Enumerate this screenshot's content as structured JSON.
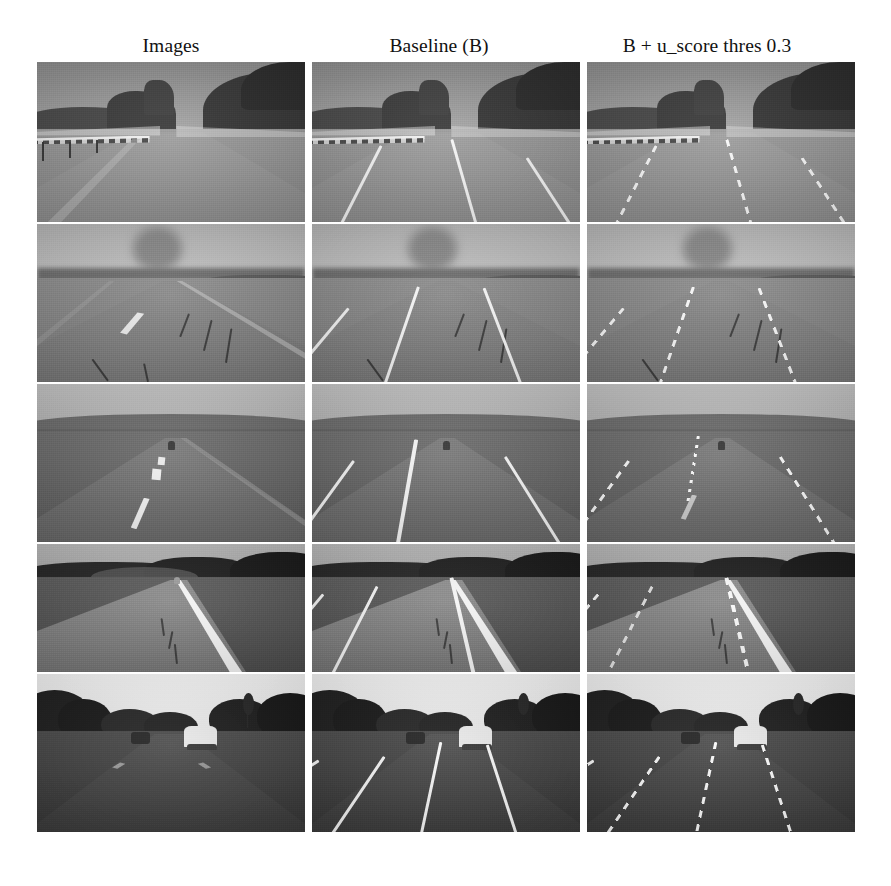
{
  "figure": {
    "type": "qualitative-comparison-grid",
    "columns": 3,
    "rows": 5,
    "colorspace": "grayscale"
  },
  "headers": [
    {
      "label": "Images"
    },
    {
      "label": "Baseline (B)"
    },
    {
      "label": "B + u_score thres 0.3"
    }
  ],
  "rows": [
    {
      "scene": "desert highway with metal guardrail and rocky mountains",
      "cells": [
        {
          "column": "Images",
          "overlay": "none"
        },
        {
          "column": "Baseline (B)",
          "overlay": "solid lane lines"
        },
        {
          "column": "B + u_score thres 0.3",
          "overlay": "dashed lane lines"
        }
      ]
    },
    {
      "scene": "straight desert road with cracked asphalt and dust plume",
      "cells": [
        {
          "column": "Images",
          "overlay": "none"
        },
        {
          "column": "Baseline (B)",
          "overlay": "solid lane lines"
        },
        {
          "column": "B + u_score thres 0.3",
          "overlay": "dashed lane lines"
        }
      ]
    },
    {
      "scene": "open desert road with dashed centerline and distant hills",
      "cells": [
        {
          "column": "Images",
          "overlay": "none"
        },
        {
          "column": "Baseline (B)",
          "overlay": "solid lane lines"
        },
        {
          "column": "B + u_score thres 0.3",
          "overlay": "dashed lane lines"
        }
      ]
    },
    {
      "scene": "two-lane road bordered by dark tree line with bright right edge line",
      "cells": [
        {
          "column": "Images",
          "overlay": "none"
        },
        {
          "column": "Baseline (B)",
          "overlay": "solid lane lines"
        },
        {
          "column": "B + u_score thres 0.3",
          "overlay": "dashed lane lines"
        }
      ]
    },
    {
      "scene": "suburban road with trees, white truck ahead and bright overcast sky",
      "cells": [
        {
          "column": "Images",
          "overlay": "none"
        },
        {
          "column": "Baseline (B)",
          "overlay": "four solid lane lines"
        },
        {
          "column": "B + u_score thres 0.3",
          "overlay": "four dashed lane lines"
        }
      ]
    }
  ],
  "colors": {
    "page_background": "#ffffff",
    "text": "#111111",
    "lane_marking": "#f2f2f0",
    "crack": "#2e2e2e"
  }
}
